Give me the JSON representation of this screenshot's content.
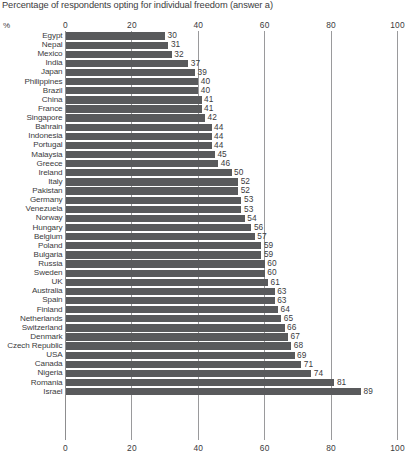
{
  "chart_data": {
    "type": "bar",
    "orientation": "horizontal",
    "title": "Percentage of respondents opting for individual freedom (answer a)",
    "xlabel": "%",
    "ylabel": "",
    "xlim": [
      0,
      100
    ],
    "xticks": [
      0,
      20,
      40,
      60,
      80,
      100
    ],
    "grid": true,
    "legend": null,
    "bar_color": "#595a5c",
    "categories": [
      "Egypt",
      "Nepal",
      "Mexico",
      "India",
      "Japan",
      "Philippines",
      "Brazil",
      "China",
      "France",
      "Singapore",
      "Bahrain",
      "Indonesia",
      "Portugal",
      "Malaysia",
      "Greece",
      "Ireland",
      "Italy",
      "Pakistan",
      "Germany",
      "Venezuela",
      "Norway",
      "Hungary",
      "Belgium",
      "Poland",
      "Bulgaria",
      "Russia",
      "Sweden",
      "UK",
      "Australia",
      "Spain",
      "Finland",
      "Netherlands",
      "Switzerland",
      "Denmark",
      "Czech Republic",
      "USA",
      "Canada",
      "Nigeria",
      "Romania",
      "Israel"
    ],
    "values": [
      30,
      31,
      32,
      37,
      39,
      40,
      40,
      41,
      41,
      42,
      44,
      44,
      44,
      45,
      46,
      50,
      52,
      52,
      53,
      53,
      54,
      56,
      57,
      59,
      59,
      60,
      60,
      61,
      63,
      63,
      64,
      65,
      66,
      67,
      68,
      69,
      71,
      74,
      81,
      89
    ]
  }
}
